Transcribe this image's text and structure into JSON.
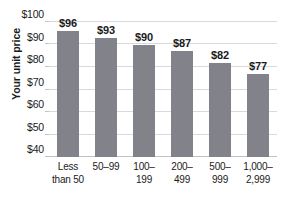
{
  "chart_data": {
    "type": "bar",
    "title": "",
    "xlabel": "",
    "ylabel": "Your unit price",
    "categories": [
      "Less than 50",
      "50–99",
      "100–199",
      "200–499",
      "500–999",
      "1,000–2,999"
    ],
    "category_lines": [
      [
        "Less",
        "than 50"
      ],
      [
        "50–99",
        ""
      ],
      [
        "100–",
        "199"
      ],
      [
        "200–",
        "499"
      ],
      [
        "500–",
        "999"
      ],
      [
        "1,000–",
        "2,999"
      ]
    ],
    "values": [
      96,
      93,
      90,
      87,
      82,
      77
    ],
    "value_labels": [
      "$96",
      "$93",
      "$90",
      "$87",
      "$82",
      "$77"
    ],
    "ylim": [
      40,
      100
    ],
    "ytick_values": [
      100,
      90,
      80,
      70,
      60,
      50,
      40
    ],
    "ytick_labels": [
      "$100",
      "$90",
      "$80",
      "$70",
      "$60",
      "$50",
      "$40"
    ],
    "grid": true,
    "legend": "none",
    "bar_color": "#82828a",
    "gridline_color": "#d9d9dd",
    "axis_color": "#c2c2c6",
    "text_color": "#1a1a1a",
    "background_color": "#ffffff"
  }
}
